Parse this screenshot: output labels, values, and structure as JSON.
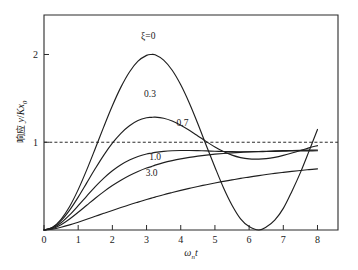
{
  "figure": {
    "background_color": "#ffffff",
    "line_color": "#1f1f1f",
    "axis_color": "#2b2b2b"
  },
  "chart_data": {
    "type": "line",
    "title": "",
    "subtitle": "",
    "xlabel": "ωₙt",
    "xlabel_parts": {
      "base": "ω",
      "sub": "n",
      "italic": "t"
    },
    "ylabel": "响应 y/Kx₀",
    "ylabel_parts": {
      "cjk": "响应",
      "num": "y",
      "slash": "/",
      "den": "Kx",
      "den_sub": "0"
    },
    "xlim": [
      0,
      8.6
    ],
    "ylim": [
      0,
      2.45
    ],
    "xticks": [
      0,
      1,
      2,
      3,
      4,
      5,
      6,
      7,
      8
    ],
    "xticklabels": [
      "0",
      "1",
      "2",
      "3",
      "4",
      "5",
      "6",
      "7",
      "8"
    ],
    "yticks": [
      1,
      2
    ],
    "yticklabels": [
      "1",
      "2"
    ],
    "grid": false,
    "legend_position": "inline-annotations",
    "reference_lines": [
      {
        "name": "steady-state",
        "axis": "y",
        "value": 1,
        "style": "dashed"
      }
    ],
    "annotations": [
      {
        "text": "ξ=0",
        "x": 3.05,
        "y": 2.18,
        "series": "zeta_0"
      },
      {
        "text": "0.3",
        "x": 3.1,
        "y": 1.52,
        "series": "zeta_0_3"
      },
      {
        "text": "0.7",
        "x": 4.05,
        "y": 1.18,
        "series": "zeta_0_7"
      },
      {
        "text": "1.0",
        "x": 3.25,
        "y": 0.8,
        "series": "zeta_1_0"
      },
      {
        "text": "3.0",
        "x": 3.15,
        "y": 0.62,
        "series": "zeta_3_0"
      }
    ],
    "x": [
      0,
      0.25,
      0.5,
      0.75,
      1,
      1.25,
      1.5,
      1.75,
      2,
      2.25,
      2.5,
      2.75,
      3,
      3.1416,
      3.25,
      3.5,
      3.75,
      4,
      4.25,
      4.5,
      4.75,
      5,
      5.25,
      5.5,
      5.75,
      6,
      6.2832,
      6.5,
      6.75,
      7,
      7.25,
      7.5,
      7.75,
      8
    ],
    "series": [
      {
        "name": "zeta_0",
        "label": "ξ=0",
        "zeta": 0,
        "values": [
          0,
          0.031,
          0.122,
          0.268,
          0.46,
          0.685,
          0.929,
          1.178,
          1.416,
          1.628,
          1.801,
          1.924,
          1.99,
          2.0,
          1.996,
          1.936,
          1.82,
          1.654,
          1.447,
          1.211,
          0.96,
          0.716,
          0.482,
          0.283,
          0.128,
          0.04,
          0.0,
          0.033,
          0.112,
          0.246,
          0.44,
          0.654,
          0.896,
          1.146
        ]
      },
      {
        "name": "zeta_0_3",
        "label": "0.3",
        "zeta": 0.3,
        "values": [
          0,
          0.028,
          0.107,
          0.227,
          0.375,
          0.537,
          0.7,
          0.854,
          0.99,
          1.102,
          1.188,
          1.247,
          1.279,
          1.283,
          1.286,
          1.274,
          1.242,
          1.194,
          1.136,
          1.072,
          1.007,
          0.946,
          0.894,
          0.853,
          0.825,
          0.81,
          0.808,
          0.813,
          0.828,
          0.85,
          0.877,
          0.906,
          0.936,
          0.962
        ]
      },
      {
        "name": "zeta_0_7",
        "label": "0.7",
        "zeta": 0.7,
        "values": [
          0,
          0.022,
          0.083,
          0.172,
          0.277,
          0.387,
          0.494,
          0.591,
          0.675,
          0.744,
          0.798,
          0.838,
          0.866,
          0.875,
          0.884,
          0.896,
          0.903,
          0.906,
          0.906,
          0.904,
          0.901,
          0.898,
          0.895,
          0.893,
          0.892,
          0.892,
          0.893,
          0.894,
          0.896,
          0.898,
          0.9,
          0.901,
          0.902,
          0.903
        ]
      },
      {
        "name": "zeta_1_0",
        "label": "1.0",
        "zeta": 1.0,
        "values": [
          0,
          0.017,
          0.061,
          0.126,
          0.202,
          0.282,
          0.362,
          0.437,
          0.506,
          0.567,
          0.621,
          0.667,
          0.706,
          0.722,
          0.739,
          0.768,
          0.791,
          0.811,
          0.828,
          0.842,
          0.854,
          0.864,
          0.872,
          0.879,
          0.885,
          0.89,
          0.894,
          0.898,
          0.901,
          0.904,
          0.906,
          0.908,
          0.91,
          0.912
        ]
      },
      {
        "name": "zeta_3_0",
        "label": "3.0",
        "zeta": 3.0,
        "values": [
          0,
          0.01,
          0.031,
          0.058,
          0.089,
          0.122,
          0.156,
          0.19,
          0.223,
          0.256,
          0.288,
          0.318,
          0.347,
          0.363,
          0.375,
          0.402,
          0.427,
          0.451,
          0.474,
          0.496,
          0.516,
          0.536,
          0.554,
          0.571,
          0.588,
          0.603,
          0.62,
          0.632,
          0.645,
          0.657,
          0.668,
          0.678,
          0.688,
          0.697
        ]
      }
    ]
  }
}
